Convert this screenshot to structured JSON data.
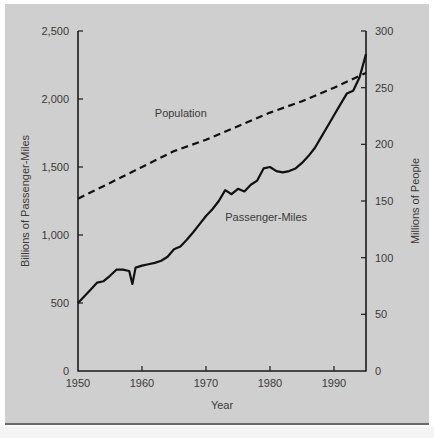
{
  "chart_data": {
    "type": "line",
    "title": "",
    "xlabel": "Year",
    "ylabel_left": "Billions of Passenger-Miles",
    "ylabel_right": "Millions of People",
    "xlim": [
      1950,
      1995
    ],
    "ylim_left": [
      0,
      2500
    ],
    "ylim_right": [
      0,
      300
    ],
    "x_ticks": [
      "1950",
      "1960",
      "1970",
      "1980",
      "1990"
    ],
    "y_ticks_left": [
      "0",
      "500",
      "1,000",
      "1,500",
      "2,000",
      "2,500"
    ],
    "y_ticks_right": [
      "0",
      "50",
      "100",
      "150",
      "200",
      "250",
      "300"
    ],
    "grid": false,
    "legend": "inline labels",
    "series": [
      {
        "name": "Passenger-Miles",
        "axis": "left",
        "style": "solid",
        "x": [
          1950,
          1951,
          1952,
          1953,
          1954,
          1955,
          1956,
          1957,
          1958,
          1958.5,
          1959,
          1960,
          1961,
          1962,
          1963,
          1964,
          1965,
          1966,
          1967,
          1968,
          1969,
          1970,
          1971,
          1972,
          1973,
          1974,
          1975,
          1976,
          1977,
          1978,
          1979,
          1980,
          1981,
          1982,
          1983,
          1984,
          1985,
          1986,
          1987,
          1988,
          1989,
          1990,
          1991,
          1992,
          1993,
          1994,
          1995
        ],
        "values": [
          500,
          550,
          600,
          650,
          660,
          700,
          745,
          745,
          735,
          640,
          760,
          775,
          785,
          795,
          810,
          840,
          895,
          915,
          965,
          1020,
          1080,
          1140,
          1190,
          1250,
          1330,
          1300,
          1340,
          1320,
          1370,
          1400,
          1490,
          1500,
          1470,
          1460,
          1470,
          1490,
          1530,
          1580,
          1640,
          1720,
          1800,
          1880,
          1960,
          2040,
          2060,
          2160,
          2330
        ]
      },
      {
        "name": "Population",
        "axis": "right",
        "style": "dashed",
        "x": [
          1950,
          1955,
          1960,
          1965,
          1970,
          1975,
          1980,
          1985,
          1990,
          1995
        ],
        "values": [
          152,
          166,
          180,
          194,
          204,
          216,
          228,
          238,
          250,
          263
        ]
      }
    ],
    "annotations": [
      {
        "text": "Population",
        "x": 1962,
        "y_left": 1865
      },
      {
        "text": "Passenger-Miles",
        "x": 1973,
        "y_left": 1100
      }
    ]
  }
}
